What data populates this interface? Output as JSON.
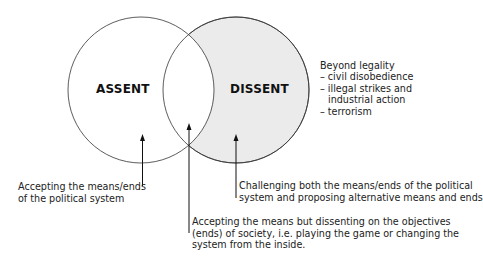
{
  "circles": {
    "assent": {
      "label": "ASSENT",
      "fill": "#ffffff"
    },
    "dissent": {
      "label": "DISSENT",
      "fill": "#ebebeb"
    }
  },
  "beyond_legality": {
    "heading": "Beyond legality",
    "items": [
      "– civil disobedience",
      "– illegal strikes and",
      "industrial action",
      "– terrorism"
    ]
  },
  "annotations": {
    "assent": {
      "lines": [
        "Accepting the means/ends",
        "of the political system"
      ]
    },
    "dissent": {
      "lines": [
        "Challenging both the means/ends of the political",
        "system and proposing alternative means and ends"
      ]
    },
    "overlap": {
      "lines": [
        "Accepting the means but dissenting on the objectives",
        "(ends) of society, i.e. playing the game or changing the",
        "system from the inside."
      ]
    }
  }
}
